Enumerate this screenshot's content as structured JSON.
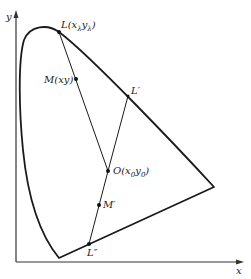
{
  "diagram": {
    "axes": {
      "x_label": "x",
      "y_label": "y"
    },
    "points": {
      "L": {
        "label": "L(x",
        "sub": "λ",
        "mid": "y",
        "sub2": "λ",
        "end": ")"
      },
      "M": {
        "label": "M(xy)"
      },
      "L_prime": {
        "label": "L′"
      },
      "O": {
        "label": "O(x",
        "sub": "0",
        "mid": "y",
        "sub2": "0",
        "end": ")"
      },
      "M_prime": {
        "label": "M′"
      },
      "L_double_prime": {
        "label": "L″"
      }
    },
    "colors": {
      "stroke": "#1a1a1a",
      "axis": "#333333"
    }
  }
}
